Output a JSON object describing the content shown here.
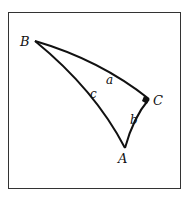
{
  "diagram": {
    "vertices": [
      {
        "name": "A",
        "label": "A"
      },
      {
        "name": "B",
        "label": "B"
      },
      {
        "name": "C",
        "label": "C"
      }
    ],
    "sides": [
      {
        "name": "a",
        "label": "a",
        "between": "B-C"
      },
      {
        "name": "b",
        "label": "b",
        "between": "C-A"
      },
      {
        "name": "c",
        "label": "c",
        "between": "A-B"
      }
    ],
    "right_angle_at": "C",
    "colors": {
      "stroke": "#111111",
      "frame": "#333333",
      "background": "#ffffff"
    }
  }
}
